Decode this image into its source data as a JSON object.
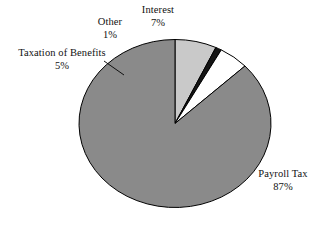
{
  "chart_data": {
    "type": "pie",
    "title": "",
    "subtitle": "",
    "xlabel": "",
    "ylabel": "",
    "legend_position": "none",
    "grid": false,
    "labels_placement": "outside-with-leader-lines",
    "start_angle_deg": 90,
    "direction": "counterclockwise",
    "categories": [
      "Interest",
      "Other",
      "Taxation of Benefits",
      "Payroll Tax"
    ],
    "values": [
      7,
      1,
      5,
      87
    ],
    "value_unit": "percent",
    "slices": [
      {
        "name": "Interest",
        "value": 7,
        "label": "Interest",
        "percent_label": "7%",
        "color": "#c9c9c9",
        "stroke": "#000000"
      },
      {
        "name": "Other",
        "value": 1,
        "label": "Other",
        "percent_label": "1%",
        "color": "#151515",
        "stroke": "#000000"
      },
      {
        "name": "Taxation of Benefits",
        "value": 5,
        "label": "Taxation of Benefits",
        "percent_label": "5%",
        "color": "#ffffff",
        "stroke": "#000000"
      },
      {
        "name": "Payroll Tax",
        "value": 87,
        "label": "Payroll Tax",
        "percent_label": "87%",
        "color": "#8a8a8a",
        "stroke": "#000000"
      }
    ]
  },
  "labels": {
    "interest": {
      "name": "Interest",
      "percent": "7%"
    },
    "other": {
      "name": "Other",
      "percent": "1%"
    },
    "taxation": {
      "name": "Taxation of Benefits",
      "percent": "5%"
    },
    "payroll": {
      "name": "Payroll Tax",
      "percent": "87%"
    }
  },
  "colors": {
    "background": "#ffffff",
    "text": "#111111",
    "outline": "#000000",
    "payroll_tax": "#8a8a8a",
    "interest": "#c9c9c9",
    "other": "#151515",
    "taxation_of_benefits": "#ffffff"
  }
}
